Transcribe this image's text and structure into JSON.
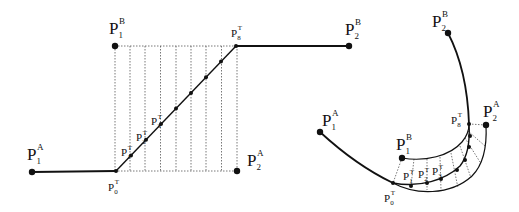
{
  "figure": {
    "left_panel": {
      "description": "straight reference configuration",
      "labels": {
        "p1a": {
          "base": "P",
          "sub": "1",
          "sup": "A"
        },
        "p1b": {
          "base": "P",
          "sub": "1",
          "sup": "B"
        },
        "p2a": {
          "base": "P",
          "sub": "2",
          "sup": "A"
        },
        "p2b": {
          "base": "P",
          "sub": "2",
          "sup": "B"
        },
        "p0t": {
          "base": "P",
          "sub": "0",
          "sup": "T"
        },
        "p1t": {
          "base": "P",
          "sub": "1",
          "sup": "T"
        },
        "p2t": {
          "base": "P",
          "sub": "2",
          "sup": "T"
        },
        "p3t": {
          "base": "P",
          "sub": "3",
          "sup": "T"
        },
        "p8t": {
          "base": "P",
          "sub": "8",
          "sup": "T"
        }
      },
      "transition_points": 9,
      "grid_columns": 8
    },
    "right_panel": {
      "description": "bent deformed configuration",
      "labels": {
        "p1a": {
          "base": "P",
          "sub": "1",
          "sup": "A"
        },
        "p1b": {
          "base": "P",
          "sub": "1",
          "sup": "B"
        },
        "p2a": {
          "base": "P",
          "sub": "2",
          "sup": "A"
        },
        "p2b": {
          "base": "P",
          "sub": "2",
          "sup": "B"
        },
        "p0t": {
          "base": "P",
          "sub": "0",
          "sup": "T"
        },
        "p1t": {
          "base": "P",
          "sub": "1",
          "sup": "T"
        },
        "p2t": {
          "base": "P",
          "sub": "2",
          "sup": "T"
        },
        "p3t": {
          "base": "P",
          "sub": "3",
          "sup": "T"
        },
        "p8t": {
          "base": "P",
          "sub": "8",
          "sup": "T"
        }
      },
      "transition_points": 9,
      "grid_columns": 8
    },
    "colors": {
      "stroke": "#111111",
      "grid": "#444444",
      "background": "#ffffff"
    }
  }
}
